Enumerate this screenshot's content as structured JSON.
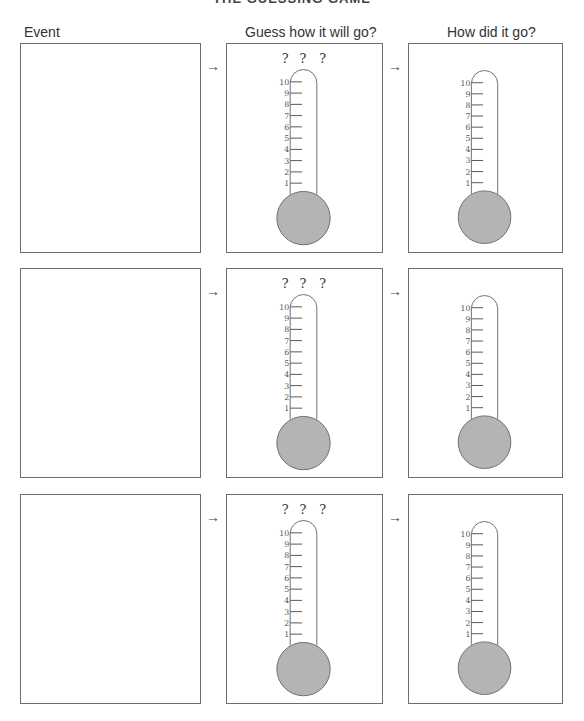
{
  "page": {
    "title": "THE GUESSING GAME"
  },
  "headers": {
    "event": "Event",
    "guess": "Guess how it will go?",
    "result": "How did it go?"
  },
  "arrow_glyph": "→",
  "question_marks": [
    "?",
    "?",
    "?"
  ],
  "scale_labels": [
    "10",
    "9",
    "8",
    "7",
    "6",
    "5",
    "4",
    "3",
    "2",
    "1"
  ],
  "colors": {
    "bulb_fill": "#b4b4b4",
    "outline": "#6e6e6e"
  },
  "rows": [
    {
      "event": "",
      "guess_value": null,
      "result_value": null
    },
    {
      "event": "",
      "guess_value": null,
      "result_value": null
    },
    {
      "event": "",
      "guess_value": null,
      "result_value": null
    }
  ]
}
